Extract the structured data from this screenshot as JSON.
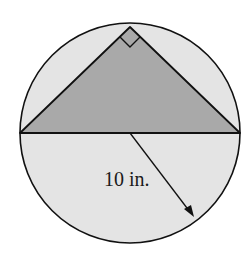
{
  "figure": {
    "radius_label": "10 in.",
    "colors": {
      "circle_fill": "#e4e4e4",
      "triangle_fill": "#a9a9a9",
      "stroke": "#111111",
      "background": "#ffffff"
    }
  }
}
